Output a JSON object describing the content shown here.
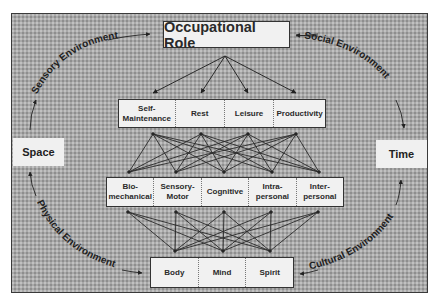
{
  "diagram": {
    "title": "Occupational Role",
    "left_node": "Space",
    "right_node": "Time",
    "environments": {
      "top_left": "Sensory Environment",
      "top_right": "Social Environment",
      "bottom_left": "Physical Environment",
      "bottom_right": "Cultural Environment"
    },
    "performance_areas": [
      {
        "line1": "Self-",
        "line2": "Maintenance"
      },
      {
        "line1": "Rest",
        "line2": ""
      },
      {
        "line1": "Leisure",
        "line2": ""
      },
      {
        "line1": "Productivity",
        "line2": ""
      }
    ],
    "performance_components": [
      {
        "line1": "Bio-",
        "line2": "mechanical"
      },
      {
        "line1": "Sensory-",
        "line2": "Motor"
      },
      {
        "line1": "Cognitive",
        "line2": ""
      },
      {
        "line1": "Intra-",
        "line2": "personal"
      },
      {
        "line1": "Inter-",
        "line2": "personal"
      }
    ],
    "person": [
      {
        "label": "Body"
      },
      {
        "label": "Mind"
      },
      {
        "label": "Spirit"
      }
    ],
    "connections": {
      "role_to_areas": "one-to-all",
      "areas_to_components": "all-to-all",
      "components_to_person": "all-to-all"
    },
    "colors": {
      "background_texture": "#a9a9a9",
      "box_fill": "#f1f1f1",
      "line": "#2a2a2a",
      "text": "#2a2a2a"
    }
  }
}
